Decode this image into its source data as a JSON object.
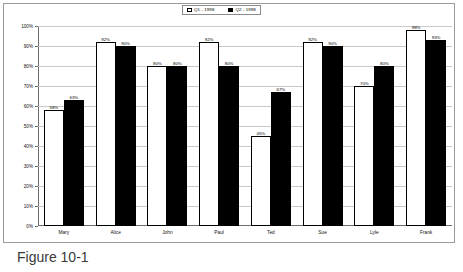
{
  "caption": "Figure 10-1",
  "legend": {
    "items": [
      {
        "label": "Q1 - 1998",
        "swatch": "white"
      },
      {
        "label": "Q2 - 1998",
        "swatch": "black"
      }
    ]
  },
  "chart_data": {
    "type": "bar",
    "title": "",
    "xlabel": "",
    "ylabel": "",
    "ylim": [
      0,
      100
    ],
    "ytick_labels": [
      "100%",
      "90%",
      "80%",
      "70%",
      "60%",
      "50%",
      "40%",
      "30%",
      "20%",
      "10%",
      "0%"
    ],
    "yticks": [
      100,
      90,
      80,
      70,
      60,
      50,
      40,
      30,
      20,
      10,
      0
    ],
    "grid": true,
    "legend_position": "top",
    "categories": [
      "Mary",
      "Alice",
      "John",
      "Paul",
      "Ted",
      "Sue",
      "Lyle",
      "Frank"
    ],
    "series": [
      {
        "name": "Q1 - 1998",
        "color": "#ffffff",
        "values": [
          58,
          92,
          80,
          92,
          45,
          92,
          70,
          98
        ],
        "labels": [
          "58%",
          "92%",
          "80%",
          "92%",
          "45%",
          "92%",
          "70%",
          "98%"
        ]
      },
      {
        "name": "Q2 - 1998",
        "color": "#000000",
        "values": [
          63,
          90,
          80,
          80,
          67,
          90,
          80,
          93
        ],
        "labels": [
          "63%",
          "90%",
          "80%",
          "80%",
          "67%",
          "90%",
          "80%",
          "93%"
        ]
      }
    ]
  }
}
